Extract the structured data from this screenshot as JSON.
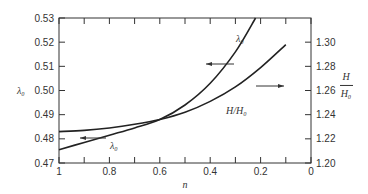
{
  "chart_data": {
    "type": "line",
    "title": "",
    "xlabel": "n",
    "ylabel_left": "λ0",
    "ylabel_right_num": "H",
    "ylabel_right_den": "H0",
    "xlim": [
      1,
      0
    ],
    "ylim_left": [
      0.47,
      0.53
    ],
    "ylim_right": [
      1.2,
      1.32
    ],
    "x_ticks": [
      "1",
      "0.8",
      "0.6",
      "0.4",
      "0.2",
      "0"
    ],
    "x_tick_values": [
      1,
      0.8,
      0.6,
      0.4,
      0.2,
      0
    ],
    "y_left_ticks": [
      "0.47",
      "0.48",
      "0.49",
      "0.50",
      "0.51",
      "0.52",
      "0.53"
    ],
    "y_left_tick_values": [
      0.47,
      0.48,
      0.49,
      0.5,
      0.51,
      0.52,
      0.53
    ],
    "y_right_ticks": [
      "1.20",
      "1.22",
      "1.24",
      "1.26",
      "1.28",
      "1.30"
    ],
    "y_right_tick_values": [
      1.2,
      1.22,
      1.24,
      1.26,
      1.28,
      1.3
    ],
    "grid": false,
    "series": [
      {
        "name": "λ0",
        "axis": "left",
        "x": [
          1.0,
          0.9,
          0.8,
          0.7,
          0.6,
          0.5,
          0.4,
          0.3,
          0.22
        ],
        "y": [
          0.4755,
          0.4785,
          0.4815,
          0.4845,
          0.488,
          0.494,
          0.503,
          0.516,
          0.53
        ]
      },
      {
        "name": "H/H0",
        "axis": "right",
        "x": [
          1.0,
          0.9,
          0.8,
          0.7,
          0.6,
          0.5,
          0.4,
          0.3,
          0.2,
          0.1
        ],
        "y": [
          1.226,
          1.227,
          1.229,
          1.232,
          1.236,
          1.242,
          1.251,
          1.263,
          1.279,
          1.298
        ]
      }
    ],
    "annotations": [
      {
        "text": "λ0",
        "target": "λ0 curve, upper label with arrow pointing left"
      },
      {
        "text": "H/H0",
        "target": "H/H0 curve label with arrow pointing right"
      },
      {
        "text": "λ0",
        "target": "lower label with arrow pointing left"
      }
    ]
  }
}
